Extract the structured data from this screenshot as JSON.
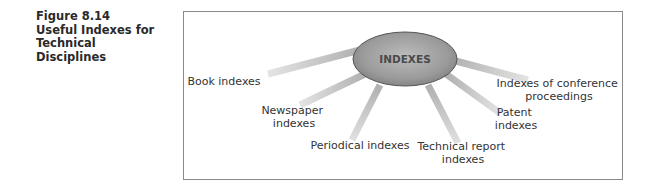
{
  "figure": {
    "caption_lines": [
      "Figure 8.14",
      "Useful Indexes for",
      "Technical",
      "Disciplines"
    ]
  },
  "diagram": {
    "hub": {
      "label": "INDEXES",
      "fill": "#9c9c9c",
      "stroke": "#555555"
    },
    "spoke_color": "#bdbdbd",
    "nodes": [
      {
        "id": "book",
        "lines": [
          "Book indexes"
        ]
      },
      {
        "id": "newspaper",
        "lines": [
          "Newspaper",
          "indexes"
        ]
      },
      {
        "id": "periodical",
        "lines": [
          "Periodical indexes"
        ]
      },
      {
        "id": "technical-report",
        "lines": [
          "Technical report",
          "indexes"
        ]
      },
      {
        "id": "patent",
        "lines": [
          "Patent",
          "indexes"
        ]
      },
      {
        "id": "conference",
        "lines": [
          "Indexes of conference",
          "proceedings"
        ]
      }
    ]
  }
}
